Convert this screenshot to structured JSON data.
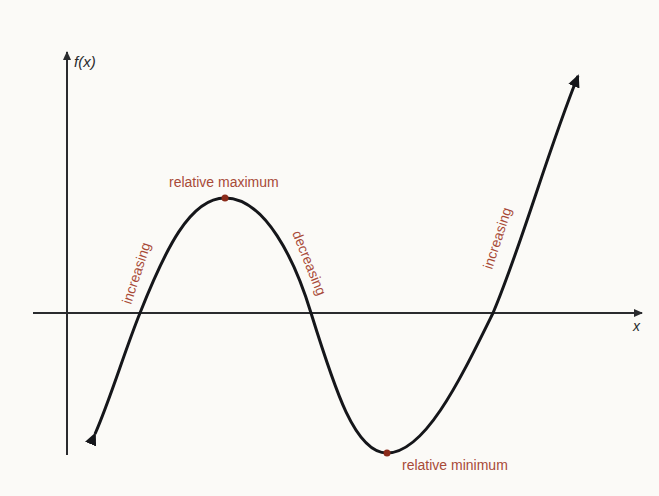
{
  "diagram": {
    "type": "function-graph",
    "axes": {
      "y_label": "f(x)",
      "x_label": "x"
    },
    "annotations": {
      "relative_maximum": "relative maximum",
      "relative_minimum": "relative minimum",
      "increasing_left": "increasing",
      "decreasing": "decreasing",
      "increasing_right": "increasing"
    },
    "colors": {
      "curve": "#15161a",
      "axes": "#2a2b2e",
      "label": "#a84a38",
      "extremum_point": "#8a2a1a",
      "background": "#fbfaf7"
    }
  }
}
